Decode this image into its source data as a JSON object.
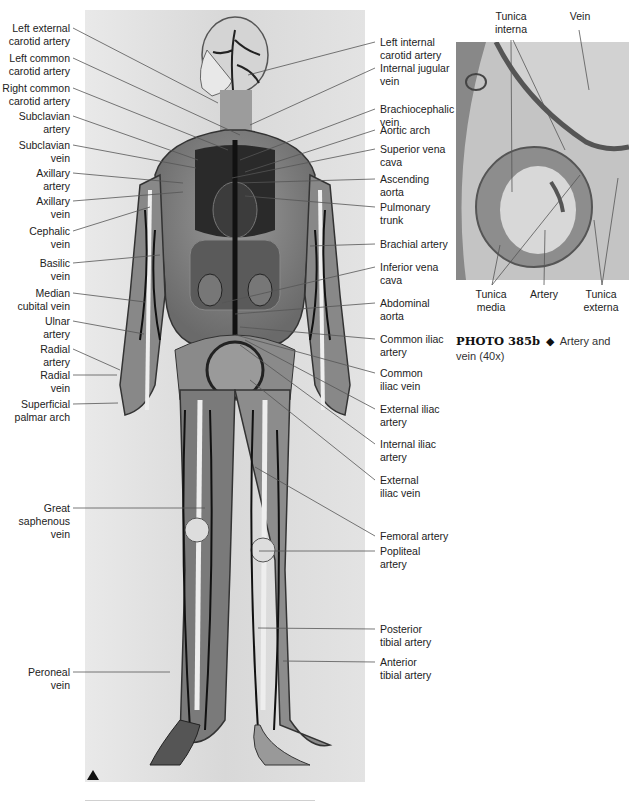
{
  "main_figure": {
    "description": "Model of human cardiovascular system, anterior view",
    "left_labels": [
      {
        "text": "Left external\ncarotid artery",
        "y": 22
      },
      {
        "text": "Left common\ncarotid artery",
        "y": 52
      },
      {
        "text": "Right common\ncarotid artery",
        "y": 82
      },
      {
        "text": "Subclavian\nartery",
        "y": 110
      },
      {
        "text": "Subclavian\nvein",
        "y": 139
      },
      {
        "text": "Axillary\nartery",
        "y": 167
      },
      {
        "text": "Axillary\nvein",
        "y": 195
      },
      {
        "text": "Cephalic\nvein",
        "y": 225
      },
      {
        "text": "Basilic\nvein",
        "y": 257
      },
      {
        "text": "Median\ncubital vein",
        "y": 287
      },
      {
        "text": "Ulnar\nartery",
        "y": 315
      },
      {
        "text": "Radial\nartery",
        "y": 343
      },
      {
        "text": "Radial\nvein",
        "y": 369
      },
      {
        "text": "Superficial\npalmar arch",
        "y": 398
      },
      {
        "text": "Great\nsaphenous\nvein",
        "y": 502
      },
      {
        "text": "Peroneal\nvein",
        "y": 666
      }
    ],
    "right_labels": [
      {
        "text": "Left internal\ncarotid artery",
        "y": 36
      },
      {
        "text": "Internal jugular\nvein",
        "y": 62
      },
      {
        "text": "Brachiocephalic\nvein",
        "y": 103
      },
      {
        "text": "Aortic arch",
        "y": 124
      },
      {
        "text": "Superior vena\ncava",
        "y": 143
      },
      {
        "text": "Ascending\naorta",
        "y": 173
      },
      {
        "text": "Pulmonary\ntrunk",
        "y": 201
      },
      {
        "text": "Brachial artery",
        "y": 238
      },
      {
        "text": "Inferior vena\ncava",
        "y": 261
      },
      {
        "text": "Abdominal\naorta",
        "y": 297
      },
      {
        "text": "Common iliac\nartery",
        "y": 333
      },
      {
        "text": "Common\niliac vein",
        "y": 367
      },
      {
        "text": "External iliac\nartery",
        "y": 403
      },
      {
        "text": "Internal iliac\nartery",
        "y": 438
      },
      {
        "text": "External\niliac vein",
        "y": 474
      },
      {
        "text": "Femoral artery",
        "y": 530
      },
      {
        "text": "Popliteal\nartery",
        "y": 545
      },
      {
        "text": "Posterior\ntibial artery",
        "y": 623
      },
      {
        "text": "Anterior\ntibial artery",
        "y": 656
      }
    ]
  },
  "micrograph": {
    "top_labels": [
      {
        "text": "Tunica\ninterna",
        "x": 496
      },
      {
        "text": "Vein",
        "x": 580
      }
    ],
    "bottom_labels": [
      {
        "text": "Tunica\nmedia",
        "x": 491
      },
      {
        "text": "Artery",
        "x": 544
      },
      {
        "text": "Tunica\nexterna",
        "x": 601
      }
    ]
  },
  "caption": {
    "number": "PHOTO 385b",
    "symbol": "◆",
    "text": "Artery and vein (40x)"
  }
}
